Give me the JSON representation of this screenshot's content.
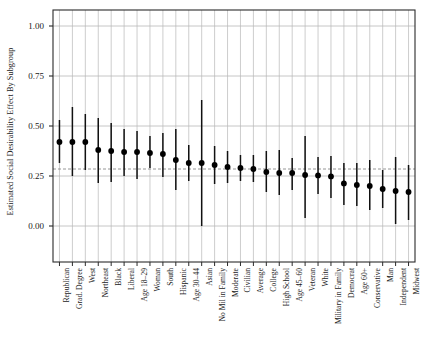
{
  "chart_data": {
    "type": "scatter",
    "title": "",
    "xlabel": "",
    "ylabel": "Estimated Social Desirability Effect By Subgroup",
    "ylim": [
      -0.18,
      1.08
    ],
    "yticks": [
      0.0,
      0.25,
      0.5,
      0.75,
      1.0
    ],
    "ytick_labels": [
      "0.00",
      "0.25",
      "0.50",
      "0.75",
      "1.00"
    ],
    "grid": true,
    "legend": "none",
    "reference_line": {
      "value": 0.285,
      "style": "dashed",
      "label": ""
    },
    "error_bar_note": "vertical line = confidence interval, filled circle = point estimate",
    "categories": [
      "Republican",
      "Grad. Degree",
      "West",
      "Northeast",
      "Black",
      "Liberal",
      "Age 18–29",
      "Woman",
      "South",
      "Hispanic",
      "Age 30–44",
      "Asian",
      "No Mil in Family",
      "Moderate",
      "Civilian",
      "Average",
      "College",
      "High School",
      "Age 45–60",
      "Veteran",
      "White",
      "Military in Family",
      "Democrat",
      "Age 60+",
      "Conservative",
      "Man",
      "Independent",
      "Midwest"
    ],
    "values": [
      0.42,
      0.42,
      0.42,
      0.38,
      0.375,
      0.37,
      0.37,
      0.365,
      0.36,
      0.33,
      0.315,
      0.315,
      0.305,
      0.295,
      0.29,
      0.285,
      0.27,
      0.265,
      0.265,
      0.255,
      0.253,
      0.248,
      0.213,
      0.205,
      0.2,
      0.185,
      0.175,
      0.17
    ],
    "ci_low": [
      0.315,
      0.25,
      0.28,
      0.215,
      0.22,
      0.25,
      0.235,
      0.29,
      0.245,
      0.18,
      0.225,
      0.0,
      0.21,
      0.215,
      0.225,
      0.22,
      0.17,
      0.155,
      0.18,
      0.04,
      0.16,
      0.14,
      0.105,
      0.1,
      0.08,
      0.09,
      0.01,
      0.03
    ],
    "ci_high": [
      0.53,
      0.595,
      0.56,
      0.54,
      0.515,
      0.485,
      0.475,
      0.45,
      0.465,
      0.485,
      0.405,
      0.63,
      0.4,
      0.375,
      0.355,
      0.355,
      0.375,
      0.38,
      0.34,
      0.45,
      0.345,
      0.35,
      0.315,
      0.315,
      0.33,
      0.28,
      0.345,
      0.305
    ]
  },
  "style": {
    "axis_color": "#2b2b2b",
    "grid_color": "#b8b8b8",
    "marker_color": "#000000",
    "bar_color": "#111111",
    "reference_line_color": "#8a8a8a",
    "background": "#ffffff"
  }
}
